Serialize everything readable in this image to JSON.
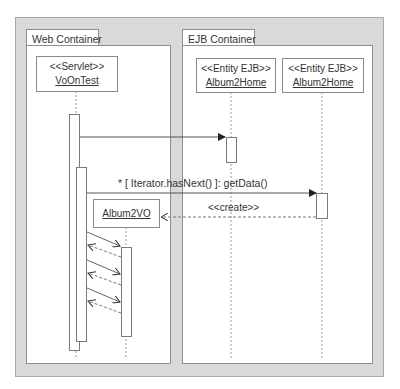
{
  "diagram": {
    "type": "UML sequence diagram",
    "containers": [
      {
        "id": "web",
        "label": "Web Container"
      },
      {
        "id": "ejb",
        "label": "EJB Container"
      }
    ],
    "lifelines": [
      {
        "id": "servlet",
        "stereotype": "<<Servlet>>",
        "name": "VoOnTest",
        "container": "web"
      },
      {
        "id": "home1",
        "stereotype": "<<Entity EJB>>",
        "name": "Album2Home",
        "container": "ejb"
      },
      {
        "id": "home2",
        "stereotype": "<<Entity EJB>>",
        "name": "Album2Home",
        "container": "ejb"
      },
      {
        "id": "vo",
        "stereotype": "",
        "name": "Album2VO",
        "container": "web"
      }
    ],
    "messages": [
      {
        "from": "servlet",
        "to": "home1",
        "label": "",
        "kind": "sync"
      },
      {
        "from": "servlet",
        "to": "home2",
        "label": "* [ Iterator.hasNext() ]: getData()",
        "kind": "sync"
      },
      {
        "from": "home2",
        "to": "vo",
        "label": "<<create>>",
        "kind": "create"
      },
      {
        "from": "servlet",
        "to": "vo",
        "label": "",
        "kind": "call"
      },
      {
        "from": "vo",
        "to": "servlet",
        "label": "",
        "kind": "return"
      },
      {
        "from": "servlet",
        "to": "vo",
        "label": "",
        "kind": "call"
      },
      {
        "from": "vo",
        "to": "servlet",
        "label": "",
        "kind": "return"
      },
      {
        "from": "servlet",
        "to": "vo",
        "label": "",
        "kind": "call"
      },
      {
        "from": "vo",
        "to": "servlet",
        "label": "",
        "kind": "return"
      }
    ],
    "colors": {
      "frame": "#d9d9d9",
      "border": "#8f8f8f",
      "line": "#555555",
      "text": "#333333"
    }
  }
}
